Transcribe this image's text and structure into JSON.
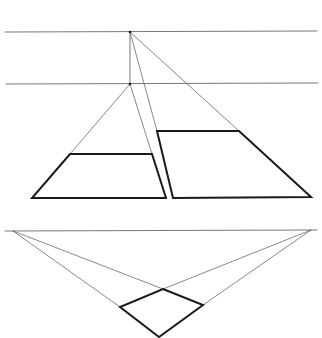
{
  "diagram": {
    "title": "",
    "background": "#ffffff",
    "line_color": "#1a1a1a",
    "thin_color": "#555555",
    "one_point": {
      "horizon_upper": {
        "x1": 5,
        "y1": 32,
        "x2": 317,
        "y2": 31
      },
      "horizon_lower": {
        "x1": 6,
        "y1": 84,
        "x2": 318,
        "y2": 83
      },
      "vp_upper": {
        "x": 130,
        "y": 32
      },
      "vp_lower": {
        "x": 130,
        "y": 84
      },
      "left_block": {
        "points": [
          [
            70,
            154
          ],
          [
            152,
            154
          ],
          [
            166,
            198
          ],
          [
            32,
            198
          ]
        ]
      },
      "right_block": {
        "points": [
          [
            157,
            131
          ],
          [
            239,
            131
          ],
          [
            311,
            197
          ],
          [
            173,
            198
          ]
        ]
      }
    },
    "two_point": {
      "horizon": {
        "x1": 5,
        "y1": 231,
        "x2": 317,
        "y2": 230
      },
      "vp_left": {
        "x": 13,
        "y": 231
      },
      "vp_right": {
        "x": 311,
        "y": 230
      },
      "box": {
        "top": [
          163,
          289
        ],
        "left": [
          120,
          307
        ],
        "right": [
          203,
          305
        ],
        "bottom": [
          159,
          337
        ]
      }
    }
  }
}
